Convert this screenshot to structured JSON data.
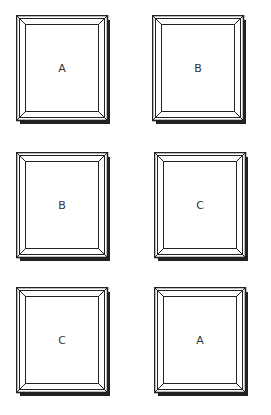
{
  "figure": {
    "layout": {
      "rows": 3,
      "cols": 2
    },
    "style": {
      "line_color": "#222222",
      "shadow_color": "#222222",
      "background": "#ffffff"
    },
    "frames": [
      {
        "label": "A",
        "x": 16,
        "y": 15
      },
      {
        "label": "B",
        "x": 152,
        "y": 15
      },
      {
        "label": "B",
        "x": 16,
        "y": 152
      },
      {
        "label": "C",
        "x": 154,
        "y": 152
      },
      {
        "label": "C",
        "x": 16,
        "y": 287
      },
      {
        "label": "A",
        "x": 154,
        "y": 287
      }
    ]
  }
}
